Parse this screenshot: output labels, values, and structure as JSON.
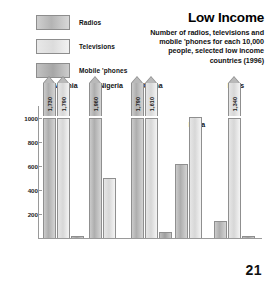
{
  "title": "Low Income",
  "subtitle": "Number of radios, televisions and mobile 'phones for each 10,000 people, selected low income countries (1996)",
  "page_number": "21",
  "legend": [
    {
      "label": "Radios",
      "swatch": "radios-swatch",
      "color": "#b4b4b4"
    },
    {
      "label": "Televisions",
      "swatch": "televisions-swatch",
      "color": "#dcdcdc"
    },
    {
      "label": "Mobile 'phones",
      "swatch": "mobile-phones-swatch",
      "color": "#a6a6a6"
    }
  ],
  "yticks": [
    "1000",
    "800",
    "600",
    "400",
    "200"
  ],
  "chart_data": {
    "type": "bar",
    "title": "Low Income",
    "subtitle": "Number of radios, televisions and mobile 'phones for each 10,000 people, selected low income countries (1996)",
    "xlabel": "",
    "ylabel": "",
    "ylim": [
      0,
      1100
    ],
    "axis_break_at": 1050,
    "grid": false,
    "legend_position": "top-left",
    "categories": [
      "Albania",
      "Nigeria",
      "China",
      "India",
      "Laos"
    ],
    "series": [
      {
        "name": "Radios",
        "values": [
          1730,
          1960,
          1790,
          615,
          140
        ],
        "broken": [
          true,
          true,
          true,
          false,
          false
        ],
        "labels": [
          "1,730",
          "1,960",
          "1,790",
          "",
          ""
        ]
      },
      {
        "name": "Televisions",
        "values": [
          1790,
          500,
          1610,
          1010,
          1340
        ],
        "broken": [
          true,
          false,
          true,
          false,
          true
        ],
        "labels": [
          "1,790",
          "",
          "1,610",
          "",
          "1,340"
        ]
      },
      {
        "name": "Mobile 'phones",
        "values": [
          20,
          0,
          50,
          0,
          20
        ],
        "broken": [
          false,
          false,
          false,
          false,
          false
        ],
        "labels": [
          "",
          "",
          "",
          "",
          ""
        ]
      }
    ]
  }
}
